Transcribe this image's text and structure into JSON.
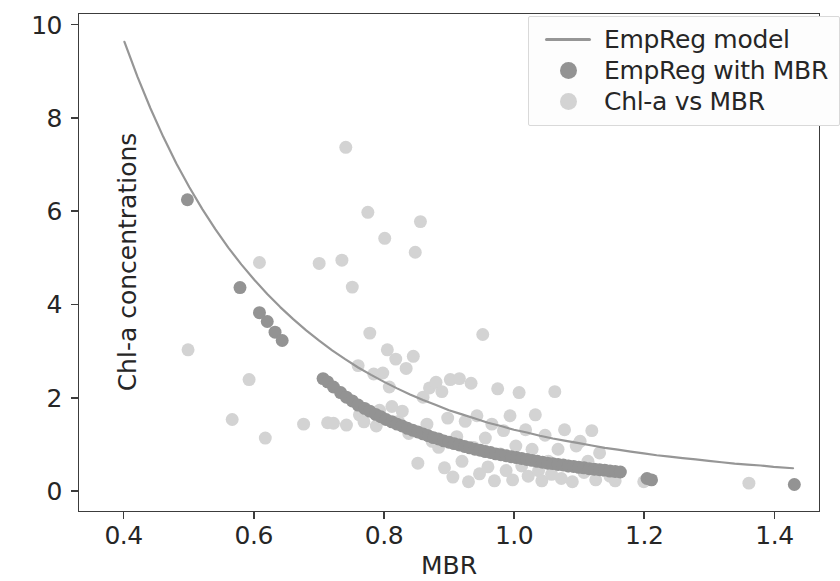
{
  "chart_data": {
    "type": "scatter",
    "title": "",
    "xlabel": "MBR",
    "ylabel": "Chl-a concentrations",
    "xlim": [
      0.33,
      1.47
    ],
    "ylim": [
      -0.45,
      10.25
    ],
    "xticks": [
      0.4,
      0.6,
      0.8,
      1.0,
      1.2,
      1.4
    ],
    "xticklabels": [
      "0.4",
      "0.6",
      "0.8",
      "1.0",
      "1.2",
      "1.4"
    ],
    "yticks": [
      0,
      2,
      4,
      6,
      8,
      10
    ],
    "yticklabels": [
      "0",
      "2",
      "4",
      "6",
      "8",
      "10"
    ],
    "grid": false,
    "legend_position": "upper right",
    "colors": {
      "model_line": "#969696",
      "empreg_marker": "#939393",
      "chla_marker": "#d3d3d3",
      "axis": "#3c3c3c",
      "text": "#262626",
      "background": "#ffffff"
    },
    "series": [
      {
        "name": "EmpReg model",
        "type": "line",
        "color": "#969696",
        "linewidth": 2.2,
        "points": [
          [
            0.4,
            9.65
          ],
          [
            0.42,
            8.9
          ],
          [
            0.44,
            8.22
          ],
          [
            0.46,
            7.6
          ],
          [
            0.48,
            7.03
          ],
          [
            0.5,
            6.52
          ],
          [
            0.52,
            6.05
          ],
          [
            0.54,
            5.62
          ],
          [
            0.56,
            5.22
          ],
          [
            0.58,
            4.86
          ],
          [
            0.6,
            4.53
          ],
          [
            0.62,
            4.22
          ],
          [
            0.64,
            3.94
          ],
          [
            0.66,
            3.68
          ],
          [
            0.68,
            3.44
          ],
          [
            0.7,
            3.22
          ],
          [
            0.72,
            3.01
          ],
          [
            0.74,
            2.82
          ],
          [
            0.76,
            2.64
          ],
          [
            0.78,
            2.48
          ],
          [
            0.8,
            2.33
          ],
          [
            0.82,
            2.19
          ],
          [
            0.84,
            2.06
          ],
          [
            0.86,
            1.94
          ],
          [
            0.88,
            1.83
          ],
          [
            0.9,
            1.72
          ],
          [
            0.92,
            1.63
          ],
          [
            0.94,
            1.54
          ],
          [
            0.96,
            1.45
          ],
          [
            0.98,
            1.38
          ],
          [
            1.0,
            1.3
          ],
          [
            1.02,
            1.24
          ],
          [
            1.04,
            1.17
          ],
          [
            1.06,
            1.11
          ],
          [
            1.08,
            1.06
          ],
          [
            1.1,
            1.01
          ],
          [
            1.12,
            0.96
          ],
          [
            1.14,
            0.91
          ],
          [
            1.16,
            0.87
          ],
          [
            1.18,
            0.83
          ],
          [
            1.2,
            0.79
          ],
          [
            1.22,
            0.75
          ],
          [
            1.24,
            0.72
          ],
          [
            1.26,
            0.69
          ],
          [
            1.28,
            0.66
          ],
          [
            1.3,
            0.63
          ],
          [
            1.32,
            0.6
          ],
          [
            1.34,
            0.57
          ],
          [
            1.36,
            0.55
          ],
          [
            1.38,
            0.53
          ],
          [
            1.4,
            0.5
          ],
          [
            1.43,
            0.47
          ]
        ]
      },
      {
        "name": "EmpReg with MBR",
        "type": "scatter",
        "color": "#939393",
        "marker_size": 13,
        "points": [
          [
            0.497,
            6.25
          ],
          [
            0.578,
            4.36
          ],
          [
            0.608,
            3.82
          ],
          [
            0.62,
            3.63
          ],
          [
            0.632,
            3.4
          ],
          [
            0.643,
            3.22
          ],
          [
            0.706,
            2.4
          ],
          [
            0.713,
            2.33
          ],
          [
            0.722,
            2.22
          ],
          [
            0.733,
            2.1
          ],
          [
            0.742,
            2.0
          ],
          [
            0.751,
            1.92
          ],
          [
            0.76,
            1.83
          ],
          [
            0.77,
            1.76
          ],
          [
            0.778,
            1.7
          ],
          [
            0.787,
            1.63
          ],
          [
            0.795,
            1.58
          ],
          [
            0.803,
            1.52
          ],
          [
            0.812,
            1.47
          ],
          [
            0.82,
            1.42
          ],
          [
            0.828,
            1.38
          ],
          [
            0.836,
            1.33
          ],
          [
            0.844,
            1.29
          ],
          [
            0.852,
            1.25
          ],
          [
            0.86,
            1.21
          ],
          [
            0.868,
            1.17
          ],
          [
            0.876,
            1.13
          ],
          [
            0.884,
            1.1
          ],
          [
            0.892,
            1.06
          ],
          [
            0.9,
            1.03
          ],
          [
            0.908,
            1.0
          ],
          [
            0.916,
            0.97
          ],
          [
            0.924,
            0.94
          ],
          [
            0.932,
            0.91
          ],
          [
            0.94,
            0.88
          ],
          [
            0.948,
            0.86
          ],
          [
            0.956,
            0.83
          ],
          [
            0.964,
            0.81
          ],
          [
            0.972,
            0.78
          ],
          [
            0.98,
            0.76
          ],
          [
            0.988,
            0.74
          ],
          [
            0.996,
            0.72
          ],
          [
            1.004,
            0.7
          ],
          [
            1.012,
            0.68
          ],
          [
            1.02,
            0.66
          ],
          [
            1.028,
            0.64
          ],
          [
            1.036,
            0.62
          ],
          [
            1.044,
            0.6
          ],
          [
            1.052,
            0.58
          ],
          [
            1.06,
            0.57
          ],
          [
            1.068,
            0.55
          ],
          [
            1.076,
            0.54
          ],
          [
            1.084,
            0.52
          ],
          [
            1.092,
            0.51
          ],
          [
            1.1,
            0.49
          ],
          [
            1.108,
            0.48
          ],
          [
            1.116,
            0.46
          ],
          [
            1.124,
            0.45
          ],
          [
            1.132,
            0.44
          ],
          [
            1.14,
            0.43
          ],
          [
            1.148,
            0.41
          ],
          [
            1.156,
            0.4
          ],
          [
            1.164,
            0.39
          ],
          [
            1.205,
            0.25
          ],
          [
            1.212,
            0.22
          ],
          [
            1.432,
            0.12
          ]
        ]
      },
      {
        "name": "Chl-a vs MBR",
        "type": "scatter",
        "color": "#d3d3d3",
        "marker_size": 13,
        "points": [
          [
            0.498,
            3.02
          ],
          [
            0.566,
            1.52
          ],
          [
            0.592,
            2.38
          ],
          [
            0.608,
            4.9
          ],
          [
            0.617,
            1.12
          ],
          [
            0.676,
            1.42
          ],
          [
            0.7,
            4.88
          ],
          [
            0.713,
            1.45
          ],
          [
            0.722,
            1.44
          ],
          [
            0.735,
            4.95
          ],
          [
            0.741,
            7.38
          ],
          [
            0.742,
            1.4
          ],
          [
            0.751,
            4.37
          ],
          [
            0.76,
            2.68
          ],
          [
            0.762,
            1.62
          ],
          [
            0.769,
            1.47
          ],
          [
            0.775,
            5.98
          ],
          [
            0.778,
            3.38
          ],
          [
            0.784,
            2.5
          ],
          [
            0.788,
            1.38
          ],
          [
            0.793,
            1.72
          ],
          [
            0.798,
            2.52
          ],
          [
            0.801,
            5.42
          ],
          [
            0.805,
            3.02
          ],
          [
            0.808,
            2.22
          ],
          [
            0.812,
            1.8
          ],
          [
            0.818,
            2.82
          ],
          [
            0.822,
            1.48
          ],
          [
            0.828,
            1.7
          ],
          [
            0.834,
            2.62
          ],
          [
            0.838,
            1.22
          ],
          [
            0.845,
            2.88
          ],
          [
            0.848,
            5.12
          ],
          [
            0.852,
            0.58
          ],
          [
            0.856,
            5.78
          ],
          [
            0.86,
            2.0
          ],
          [
            0.866,
            1.42
          ],
          [
            0.87,
            2.2
          ],
          [
            0.874,
            1.05
          ],
          [
            0.88,
            2.32
          ],
          [
            0.884,
            0.92
          ],
          [
            0.889,
            2.12
          ],
          [
            0.893,
            0.48
          ],
          [
            0.898,
            1.55
          ],
          [
            0.902,
            2.38
          ],
          [
            0.906,
            0.28
          ],
          [
            0.912,
            1.15
          ],
          [
            0.916,
            2.4
          ],
          [
            0.92,
            0.62
          ],
          [
            0.925,
            1.48
          ],
          [
            0.93,
            0.18
          ],
          [
            0.934,
            2.3
          ],
          [
            0.938,
            0.92
          ],
          [
            0.943,
            1.6
          ],
          [
            0.947,
            0.35
          ],
          [
            0.952,
            3.35
          ],
          [
            0.956,
            1.12
          ],
          [
            0.96,
            0.5
          ],
          [
            0.966,
            1.42
          ],
          [
            0.97,
            0.2
          ],
          [
            0.975,
            2.18
          ],
          [
            0.979,
            0.78
          ],
          [
            0.984,
            1.28
          ],
          [
            0.988,
            0.42
          ],
          [
            0.994,
            1.6
          ],
          [
            0.998,
            0.22
          ],
          [
            1.003,
            0.95
          ],
          [
            1.008,
            2.1
          ],
          [
            1.012,
            0.52
          ],
          [
            1.018,
            1.3
          ],
          [
            1.022,
            0.3
          ],
          [
            1.028,
            0.88
          ],
          [
            1.033,
            1.62
          ],
          [
            1.038,
            0.42
          ],
          [
            1.043,
            0.2
          ],
          [
            1.048,
            1.18
          ],
          [
            1.053,
            0.62
          ],
          [
            1.058,
            0.34
          ],
          [
            1.063,
            2.12
          ],
          [
            1.068,
            0.88
          ],
          [
            1.073,
            0.25
          ],
          [
            1.078,
            1.3
          ],
          [
            1.083,
            0.52
          ],
          [
            1.09,
            0.18
          ],
          [
            1.096,
            0.95
          ],
          [
            1.102,
            1.05
          ],
          [
            1.108,
            0.38
          ],
          [
            1.114,
            0.62
          ],
          [
            1.12,
            1.28
          ],
          [
            1.126,
            0.22
          ],
          [
            1.132,
            0.8
          ],
          [
            1.14,
            0.42
          ],
          [
            1.148,
            0.3
          ],
          [
            1.156,
            0.2
          ],
          [
            1.2,
            0.18
          ],
          [
            1.362,
            0.15
          ]
        ]
      }
    ]
  },
  "legend": {
    "entries": [
      {
        "label": "EmpReg model",
        "key": "line",
        "color": "#969696"
      },
      {
        "label": "EmpReg with MBR",
        "key": "dot-dark",
        "color": "#939393"
      },
      {
        "label": "Chl-a vs MBR",
        "key": "dot-light",
        "color": "#d3d3d3"
      }
    ]
  },
  "axes": {
    "xlabel": "MBR",
    "ylabel": "Chl-a concentrations",
    "xticklabels": [
      "0.4",
      "0.6",
      "0.8",
      "1.0",
      "1.2",
      "1.4"
    ],
    "yticklabels": [
      "0",
      "2",
      "4",
      "6",
      "8",
      "10"
    ]
  }
}
